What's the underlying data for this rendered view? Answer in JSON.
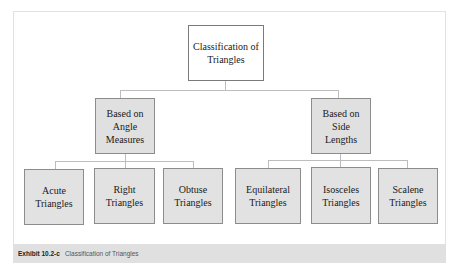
{
  "diagram": {
    "root": {
      "label": "Classification of\nTriangles"
    },
    "branches": [
      {
        "label": "Based on\nAngle\nMeasures",
        "children": [
          {
            "label": "Acute\nTriangles"
          },
          {
            "label": "Right\nTriangles"
          },
          {
            "label": "Obtuse\nTriangles"
          }
        ]
      },
      {
        "label": "Based on\nSide\nLengths",
        "children": [
          {
            "label": "Equilateral\nTriangles"
          },
          {
            "label": "Isosceles\nTriangles"
          },
          {
            "label": "Scalene\nTriangles"
          }
        ]
      }
    ]
  },
  "caption": {
    "label": "Exhibit 10.2-c",
    "text": "Classification of Triangles"
  },
  "colors": {
    "box_fill": "#e0e0e0",
    "box_border": "#8c8c8c",
    "connector": "#bdbdbd",
    "caption_bar": "#e0e0e0"
  }
}
